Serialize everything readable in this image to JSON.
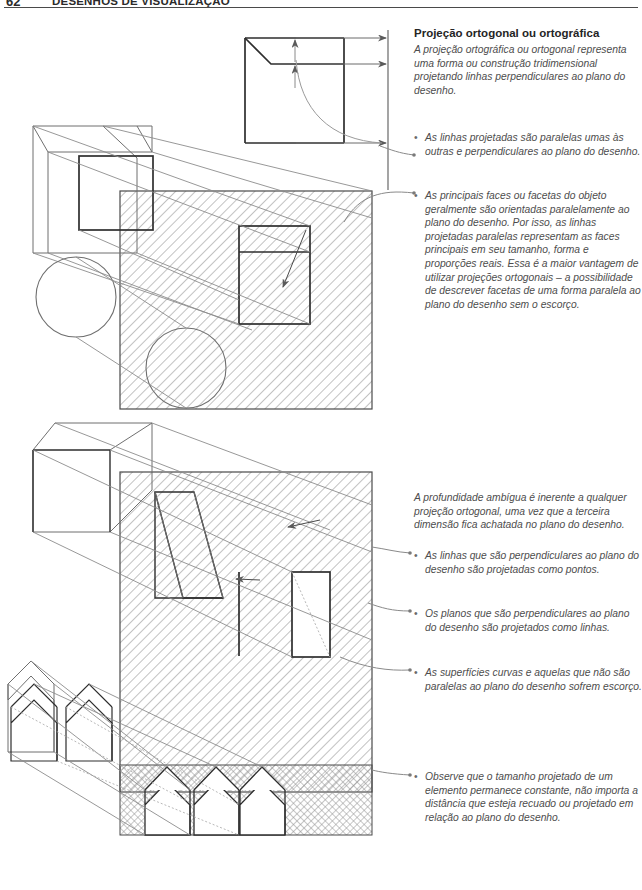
{
  "running_head": {
    "folio": "62",
    "book_title": "DESENHOS DE VISUALIZAÇÃO"
  },
  "section": {
    "heading": "Projeção ortogonal ou ortográfica",
    "intro": "A projeção ortográfica ou ortogonal representa uma forma ou construção tridimensional projetando linhas perpendiculares ao plano do desenho.",
    "bullet_marker": "•"
  },
  "bullets": [
    {
      "id": "bullet-linhas-paralelas",
      "text": "As linhas projetadas são paralelas umas às outras e perpendiculares ao plano do desenho."
    },
    {
      "id": "bullet-faces-principais",
      "text": "As principais faces ou facetas do objeto geralmente são orientadas paralelamente ao plano do desenho. Por isso, as linhas projetadas paralelas representam as faces principais em seu tamanho, forma e proporções reais. Essa é a maior vantagem de utilizar projeções ortogonais – a possibilidade de descrever facetas de uma forma paralela ao plano do desenho sem o escorço."
    },
    {
      "id": "bullet-profundidade-ambigua",
      "text": "A profundidade ambígua é inerente a qualquer projeção ortogonal, uma vez que a terceira dimensão fica achatada no plano do desenho."
    },
    {
      "id": "bullet-linhas-pontos",
      "text": "As linhas que são perpendiculares ao plano do desenho são projetadas como pontos."
    },
    {
      "id": "bullet-planos-linhas",
      "text": "Os planos que são perpendiculares ao plano do desenho são projetados como linhas."
    },
    {
      "id": "bullet-superficies-curvas",
      "text": "As superfícies curvas e aquelas que não são paralelas ao plano do desenho sofrem escorço."
    },
    {
      "id": "bullet-tamanho-constante",
      "text": "Observe que o tamanho projetado de um elemento permanece constante, não importa a distância que esteja recuado ou projetado em relação ao plano do desenho."
    }
  ],
  "figures": [
    {
      "id": "figure-top-projection",
      "caption": "Diagrama de projeção ortogonal: caixa com chanfro, cubo, cilindros e plano do desenho hachurado"
    },
    {
      "id": "figure-middle-projection",
      "caption": "Diagrama de profundidade ambígua: prisma inclinado projetado sobre plano hachurado"
    },
    {
      "id": "figure-bottom-projection",
      "caption": "Diagrama de tamanho constante: três casas recuadas projetadas no plano do desenho"
    }
  ],
  "colors": {
    "ink": "#3a3a3a",
    "heading": "#252525",
    "body": "#4d4d4d",
    "line_dark": "#2e2e2e",
    "line_light": "#8c8c8c",
    "hatch": "#8f8f8f",
    "rule": "#4a4a4a"
  }
}
